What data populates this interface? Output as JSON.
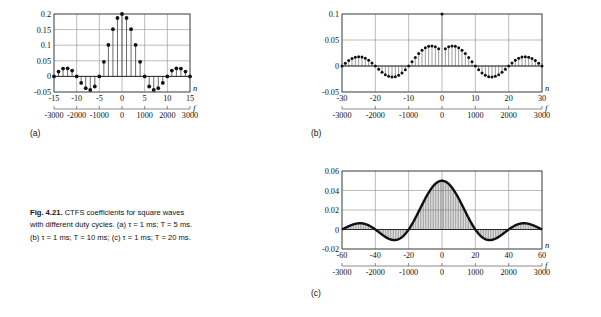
{
  "figure": {
    "label": "Fig. 4.21.",
    "caption_main": "CTFS coefficients for square waves with different duty cycles.",
    "caption_a": "(a) τ = 1 ms; T = 5 ms.",
    "caption_b": "(b) τ = 1 ms; T = 10 ms;",
    "caption_c": "(c) τ = 1 ms; T = 20 ms."
  },
  "panels": {
    "a": {
      "tag": "(a)",
      "n_axis_label": "n",
      "f_axis_label": "f",
      "y_ticks": [
        "0.2",
        "0.15",
        "0.1",
        "0.05",
        "0",
        "-0.05"
      ],
      "y_values": [
        0.2,
        0.15,
        0.1,
        0.05,
        0,
        -0.05
      ],
      "n_ticks": [
        "-15",
        "-10",
        "-5",
        "0",
        "5",
        "10",
        "15"
      ],
      "n_values": [
        -15,
        -10,
        -5,
        0,
        5,
        10,
        15
      ],
      "f_ticks": [
        "-3000",
        "-2000",
        "-1000",
        "0",
        "1000",
        "2000",
        "3000"
      ],
      "f_values": [
        -3000,
        -2000,
        -1000,
        0,
        1000,
        2000,
        3000
      ]
    },
    "b": {
      "tag": "(b)",
      "n_axis_label": "n",
      "f_axis_label": "f",
      "y_ticks": [
        "0.1",
        "0.05",
        "0",
        "-0.05"
      ],
      "y_values": [
        0.1,
        0.05,
        0,
        -0.05
      ],
      "n_ticks": [
        "-30",
        "-20",
        "-10",
        "0",
        "10",
        "20",
        "30"
      ],
      "n_values": [
        -30,
        -20,
        -10,
        0,
        10,
        20,
        30
      ],
      "f_ticks": [
        "-3000",
        "-2000",
        "-1000",
        "0",
        "1000",
        "2000",
        "3000"
      ],
      "f_values": [
        -3000,
        -2000,
        -1000,
        0,
        1000,
        2000,
        3000
      ]
    },
    "c": {
      "tag": "(c)",
      "n_axis_label": "n",
      "f_axis_label": "f",
      "y_ticks": [
        "0.06",
        "0.04",
        "0.02",
        "0",
        "-0.02"
      ],
      "y_values": [
        0.06,
        0.04,
        0.02,
        0,
        -0.02
      ],
      "n_ticks": [
        "-60",
        "-40",
        "-20",
        "0",
        "20",
        "40",
        "60"
      ],
      "n_values": [
        -60,
        -40,
        -20,
        0,
        20,
        40,
        60
      ],
      "f_ticks": [
        "-3000",
        "-2000",
        "-1000",
        "0",
        "1000",
        "2000",
        "3000"
      ],
      "f_values": [
        -3000,
        -2000,
        -1000,
        0,
        1000,
        2000,
        3000
      ]
    }
  },
  "chart_data": [
    {
      "type": "stem",
      "id": "a",
      "title": "(a) tau = 1 ms; T = 5 ms",
      "xlabel": "n",
      "ylabel": "",
      "xlim": [
        -15,
        15
      ],
      "ylim": [
        -0.05,
        0.2
      ],
      "grid": true,
      "legend": "none",
      "secondary_xaxis": {
        "label": "f",
        "lim": [
          -3000,
          3000
        ]
      },
      "duty": 0.2,
      "x": [
        -15,
        -14,
        -13,
        -12,
        -11,
        -10,
        -9,
        -8,
        -7,
        -6,
        -5,
        -4,
        -3,
        -2,
        -1,
        0,
        1,
        2,
        3,
        4,
        5,
        6,
        7,
        8,
        9,
        10,
        11,
        12,
        13,
        14,
        15
      ],
      "y": [
        0.0,
        0.0156,
        0.0251,
        0.0259,
        0.0187,
        0.0,
        -0.0208,
        -0.0378,
        -0.0432,
        -0.0324,
        0.0,
        0.0468,
        0.1009,
        0.1514,
        0.1871,
        0.2,
        0.1871,
        0.1514,
        0.1009,
        0.0468,
        0.0,
        -0.0324,
        -0.0432,
        -0.0378,
        -0.0208,
        0.0,
        0.0187,
        0.0259,
        0.0251,
        0.0156,
        0.0
      ]
    },
    {
      "type": "stem",
      "id": "b",
      "title": "(b) tau = 1 ms; T = 10 ms",
      "xlabel": "n",
      "ylabel": "",
      "xlim": [
        -30,
        30
      ],
      "ylim": [
        -0.05,
        0.1
      ],
      "grid": true,
      "legend": "none",
      "secondary_xaxis": {
        "label": "f",
        "lim": [
          -3000,
          3000
        ]
      },
      "duty": 0.1,
      "x": [
        -30,
        -29,
        -28,
        -27,
        -26,
        -25,
        -24,
        -23,
        -22,
        -21,
        -20,
        -19,
        -18,
        -17,
        -16,
        -15,
        -14,
        -13,
        -12,
        -11,
        -10,
        -9,
        -8,
        -7,
        -6,
        -5,
        -4,
        -3,
        -2,
        -1,
        0,
        1,
        2,
        3,
        4,
        5,
        6,
        7,
        8,
        9,
        10,
        11,
        12,
        13,
        14,
        15,
        16,
        17,
        18,
        19,
        20,
        21,
        22,
        23,
        24,
        25,
        26,
        27,
        28,
        29,
        30
      ],
      "y": [
        0.0,
        0.0054,
        0.0104,
        0.0144,
        0.017,
        0.018,
        0.0172,
        0.0148,
        0.011,
        0.006,
        0.0,
        -0.0062,
        -0.012,
        -0.0167,
        -0.0199,
        -0.0212,
        -0.0205,
        -0.0178,
        -0.0133,
        -0.0074,
        0.0,
        0.008,
        0.0162,
        0.0239,
        0.0303,
        0.035,
        0.0378,
        0.0384,
        0.0368,
        0.033,
        0.1,
        0.033,
        0.0368,
        0.0384,
        0.0378,
        0.035,
        0.0303,
        0.0239,
        0.0162,
        0.008,
        0.0,
        -0.0074,
        -0.0133,
        -0.0178,
        -0.0205,
        -0.0212,
        -0.0199,
        -0.0167,
        -0.012,
        -0.0062,
        0.0,
        0.006,
        0.011,
        0.0148,
        0.0172,
        0.018,
        0.017,
        0.0144,
        0.0104,
        0.0054,
        0.0
      ]
    },
    {
      "type": "stem",
      "id": "c",
      "title": "(c) tau = 1 ms; T = 20 ms",
      "xlabel": "n",
      "ylabel": "",
      "xlim": [
        -60,
        60
      ],
      "ylim": [
        -0.02,
        0.06
      ],
      "grid": true,
      "legend": "none",
      "secondary_xaxis": {
        "label": "f",
        "lim": [
          -3000,
          3000
        ]
      },
      "duty": 0.05,
      "peak": 0.05
    }
  ]
}
